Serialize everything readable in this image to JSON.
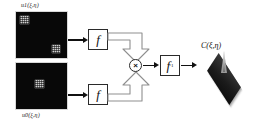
{
  "figure": {
    "type": "block-diagram",
    "background_color": "#ffffff",
    "line_color": "#111111"
  },
  "inputs": [
    {
      "id": "input-top",
      "caption": "u1(ξ,η)",
      "caption_position": "above",
      "description": "binary speckle scene, dark field with two bright blocks",
      "field_color": "#080808",
      "features": [
        {
          "name": "bright-block-top-left",
          "x_pct": 8,
          "y_pct": 9,
          "w_pct": 17,
          "h_pct": 17
        },
        {
          "name": "bright-block-bottom-right",
          "x_pct": 70,
          "y_pct": 72,
          "w_pct": 17,
          "h_pct": 17
        }
      ]
    },
    {
      "id": "input-bottom",
      "caption": "u0(ξ,η)",
      "caption_position": "below",
      "description": "reference target, dark field with one centered bright block",
      "field_color": "#080808",
      "features": [
        {
          "name": "bright-block-center",
          "x_pct": 37,
          "y_pct": 37,
          "w_pct": 18,
          "h_pct": 18
        }
      ]
    }
  ],
  "operators": [
    {
      "id": "ft-top",
      "symbol": "f",
      "superscript": "",
      "label": "Fourier transform"
    },
    {
      "id": "ft-bottom",
      "symbol": "f",
      "superscript": "",
      "label": "Fourier transform"
    },
    {
      "id": "ift",
      "symbol": "f",
      "superscript": "-1",
      "label": "Inverse Fourier transform"
    }
  ],
  "multiplier": {
    "id": "multiply-node",
    "symbol": "×",
    "label": "multiply"
  },
  "output": {
    "id": "correlation-plot",
    "label": "C(ξ,η)",
    "description": "3D surface plot of the correlation plane with a sharp central peak",
    "plot_type": "surface",
    "base_color": "#1b1b1b",
    "peak_color": "#e8e8e8"
  },
  "connections": [
    {
      "from": "input-top",
      "to": "ft-top",
      "style": "solid-arrow"
    },
    {
      "from": "input-bottom",
      "to": "ft-bottom",
      "style": "solid-arrow"
    },
    {
      "from": "ft-top",
      "to": "multiply-node",
      "style": "hollow-block-arrow"
    },
    {
      "from": "ft-bottom",
      "to": "multiply-node",
      "style": "hollow-block-arrow"
    },
    {
      "from": "multiply-node",
      "to": "ift",
      "style": "solid-arrow"
    },
    {
      "from": "ift",
      "to": "correlation-plot",
      "style": "solid-arrow"
    }
  ]
}
